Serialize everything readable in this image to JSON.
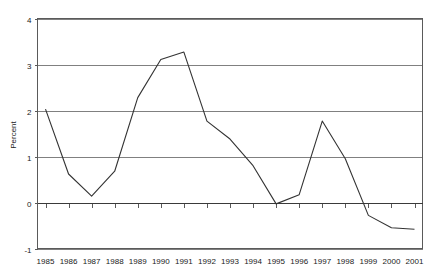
{
  "chart_data": {
    "type": "line",
    "title": "",
    "subtitle": "",
    "xlabel": "",
    "ylabel": "Percent",
    "ylim": [
      -1,
      4
    ],
    "yticks": [
      4,
      3,
      2,
      1,
      0,
      -1
    ],
    "ytick_labels": [
      "4",
      "3",
      "2",
      "1",
      "0",
      "-1"
    ],
    "grid": true,
    "legend": "none",
    "categories": [
      "1985",
      "1986",
      "1987",
      "1988",
      "1989",
      "1990",
      "1991",
      "1992",
      "1993",
      "1994",
      "1995",
      "1996",
      "1997",
      "1998",
      "1999",
      "2000",
      "2001"
    ],
    "x": [
      1985,
      1986,
      1987,
      1988,
      1989,
      1990,
      1991,
      1992,
      1993,
      1994,
      1995,
      1996,
      1997,
      1998,
      1999,
      2000,
      2001
    ],
    "values": [
      2.03,
      0.62,
      0.14,
      0.68,
      2.28,
      3.11,
      3.27,
      1.77,
      1.38,
      0.8,
      -0.03,
      0.17,
      1.77,
      0.95,
      -0.28,
      -0.55,
      -0.58
    ],
    "series": [
      {
        "name": "Percent",
        "values": [
          2.03,
          0.62,
          0.14,
          0.68,
          2.28,
          3.11,
          3.27,
          1.77,
          1.38,
          0.8,
          -0.03,
          0.17,
          1.77,
          0.95,
          -0.28,
          -0.55,
          -0.58
        ]
      }
    ],
    "annotations": [],
    "zero_line": 0,
    "line_color": "#333333",
    "grid_color": "#808080"
  }
}
